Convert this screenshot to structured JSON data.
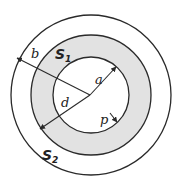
{
  "diagram": {
    "title": "",
    "colors": {
      "stroke": "#2a2a2a",
      "shaded_region": "#e2e2e2",
      "background": "#ffffff"
    },
    "circles": [
      {
        "id": "outer",
        "label": "S2",
        "radius_label": "b"
      },
      {
        "id": "middle",
        "label": "S1",
        "radius_label": "d"
      },
      {
        "id": "inner",
        "radius_label": "a"
      }
    ],
    "labels": {
      "b": "b",
      "a": "a",
      "d": "d",
      "p": "p",
      "S1_main": "S",
      "S1_sub": "1",
      "S2_main": "S",
      "S2_sub": "2"
    }
  }
}
